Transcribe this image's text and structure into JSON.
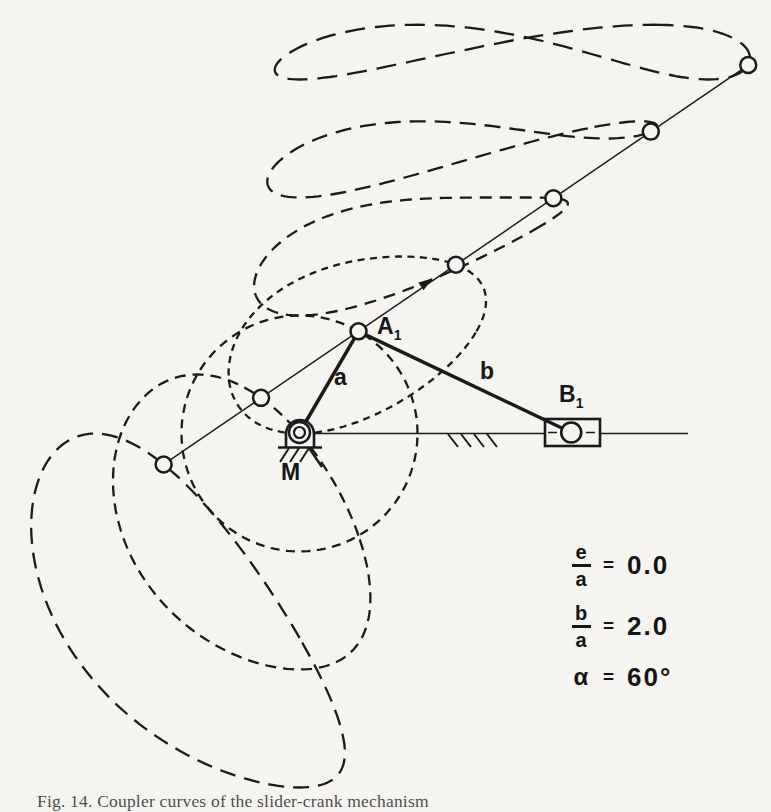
{
  "figure": {
    "caption": "Fig. 14. Coupler curves of the slider-crank mechanism",
    "labels": {
      "crank_pin": "A",
      "crank_pin_sub": "1",
      "slider_pin": "B",
      "slider_pin_sub": "1",
      "fixed_pivot": "M",
      "crank_link": "a",
      "coupler_link": "b"
    },
    "parameters": [
      {
        "type": "fraction",
        "numerator": "e",
        "denominator": "a",
        "equals": "=",
        "value": "0.0"
      },
      {
        "type": "fraction",
        "numerator": "b",
        "denominator": "a",
        "equals": "=",
        "value": "2.0"
      },
      {
        "type": "plain",
        "symbol": "α",
        "equals": "=",
        "value": "60°"
      }
    ]
  },
  "mechanism": {
    "e_over_a": 0.0,
    "b_over_a": 2.0,
    "alpha_deg": 60,
    "crank_angle_deg": 60,
    "coupler_point_offsets": [
      4,
      3,
      2,
      1,
      0,
      -1,
      -2
    ]
  },
  "colors": {
    "ink": "#1a1a1a",
    "paper": "#f5f4f0"
  }
}
